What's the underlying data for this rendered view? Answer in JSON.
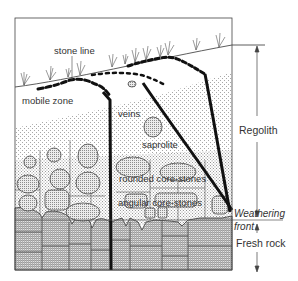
{
  "diagram": {
    "labels": {
      "stone_line": "stone line",
      "mobile_zone": "mobile zone",
      "veins": "veins",
      "saprolite": "saprolite",
      "rounded_core_stones": "rounded core-stones",
      "angular_core_stones": "angular core-stones",
      "regolith": "Regolith",
      "weathering_front_1": "Weathering",
      "weathering_front_2": "front",
      "fresh_rock": "Fresh rock"
    },
    "colors": {
      "line": "#222222",
      "stipple": "#9a9a9a",
      "core_stone_fill": "#c8c8c8",
      "rock_fill": "#d6d6d6",
      "background": "#ffffff"
    }
  }
}
